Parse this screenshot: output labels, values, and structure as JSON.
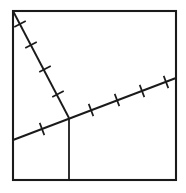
{
  "figure": {
    "background_color": "#ffffff",
    "ink_color": "#1a1a1a"
  },
  "chart_data": {
    "type": "diagram",
    "xlabel": "",
    "ylabel": "",
    "xlim": [
      0,
      186
    ],
    "ylim": [
      0,
      193
    ],
    "grid": false,
    "legend": null,
    "shapes": [
      {
        "name": "square-frame",
        "kind": "rectangle",
        "x": 13,
        "y": 11,
        "width": 163,
        "height": 169,
        "stroke": "#1a1a1a",
        "stroke_width": 2.1,
        "fill": "none"
      },
      {
        "name": "descending-segment",
        "kind": "line",
        "x1": 13,
        "y1": 11,
        "x2": 69,
        "y2": 118,
        "stroke": "#1a1a1a",
        "stroke_width": 1.9,
        "tick_count": 4
      },
      {
        "name": "ascending-segment",
        "kind": "line",
        "x1": 13,
        "y1": 140,
        "x2": 176,
        "y2": 78,
        "stroke": "#1a1a1a",
        "stroke_width": 1.9,
        "tick_count": 6
      },
      {
        "name": "vertical-segment",
        "kind": "line",
        "x1": 69,
        "y1": 118,
        "x2": 69,
        "y2": 180,
        "stroke": "#1a1a1a",
        "stroke_width": 1.8,
        "tick_count": 0
      }
    ],
    "points": [
      {
        "name": "top-left-vertex",
        "x": 13,
        "y": 11
      },
      {
        "name": "top-right-vertex",
        "x": 176,
        "y": 11
      },
      {
        "name": "bottom-right-vertex",
        "x": 176,
        "y": 180
      },
      {
        "name": "bottom-left-vertex",
        "x": 13,
        "y": 180
      },
      {
        "name": "junction-point",
        "x": 69,
        "y": 118
      },
      {
        "name": "ascending-left-endpoint",
        "x": 13,
        "y": 140
      },
      {
        "name": "ascending-right-endpoint",
        "x": 176,
        "y": 78
      },
      {
        "name": "vertical-foot",
        "x": 69,
        "y": 180
      }
    ],
    "tick_marks": {
      "descending_segment": [
        {
          "x": 20,
          "y": 24
        },
        {
          "x": 31,
          "y": 45
        },
        {
          "x": 45,
          "y": 69
        },
        {
          "x": 58,
          "y": 94
        }
      ],
      "ascending_segment": [
        {
          "x": 42,
          "y": 129
        },
        {
          "x": 91,
          "y": 110
        },
        {
          "x": 117,
          "y": 100
        },
        {
          "x": 142,
          "y": 91
        },
        {
          "x": 166,
          "y": 82
        }
      ],
      "tick_length": 13,
      "note": "Tick marks drawn perpendicular to each segment indicating congruent lengths"
    }
  }
}
